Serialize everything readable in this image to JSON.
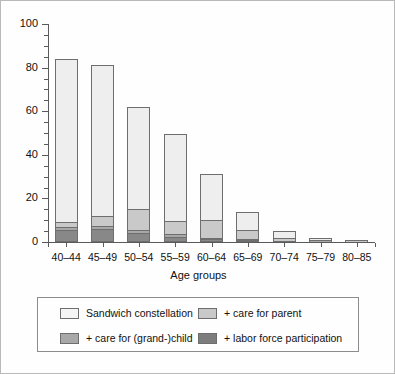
{
  "chart_data": {
    "type": "bar",
    "title": "",
    "subtitle": "",
    "xlabel": "Age groups",
    "ylabel": "",
    "ylim": [
      0,
      100
    ],
    "yticks": [
      0,
      20,
      40,
      60,
      80,
      100
    ],
    "ytick_labels": [
      "0",
      "20",
      "40",
      "60",
      "80",
      "100"
    ],
    "grid": false,
    "stacked": true,
    "legend_position": "bottom",
    "categories": [
      "40–44",
      "45–49",
      "50–54",
      "55–59",
      "60–64",
      "65–69",
      "70–74",
      "75–79",
      "80–85"
    ],
    "series": [
      {
        "name": "+ labor force participation",
        "color": "#888888",
        "values": [
          5.5,
          6.0,
          4.0,
          2.5,
          1.5,
          1.0,
          0.4,
          0.2,
          0.1
        ]
      },
      {
        "name": "+ care for (grand-)child",
        "color": "#a8a8a8",
        "values": [
          1.5,
          1.5,
          1.5,
          1.0,
          0.5,
          0.5,
          0.2,
          0.1,
          0.1
        ]
      },
      {
        "name": "+ care for parent",
        "color": "#c9c9c9",
        "values": [
          2.0,
          4.5,
          9.5,
          6.0,
          8.0,
          4.0,
          1.4,
          0.5,
          0.2
        ]
      },
      {
        "name": "Sandwich constellation",
        "color": "#eeeeee",
        "values": [
          75.0,
          69.0,
          47.0,
          40.0,
          21.0,
          8.5,
          3.0,
          1.2,
          0.6
        ]
      }
    ],
    "totals": [
      84.0,
      81.0,
      62.0,
      49.5,
      31.0,
      14.0,
      5.0,
      2.0,
      1.0
    ]
  },
  "legend": {
    "entries": [
      {
        "label": "Sandwich constellation",
        "color": "#f5f5f5"
      },
      {
        "label": "+ care for parent",
        "color": "#c9c9c9"
      },
      {
        "label": "+ care for (grand-)child",
        "color": "#a8a8a8"
      },
      {
        "label": "+ labor force participation",
        "color": "#7d7d7d"
      }
    ]
  }
}
